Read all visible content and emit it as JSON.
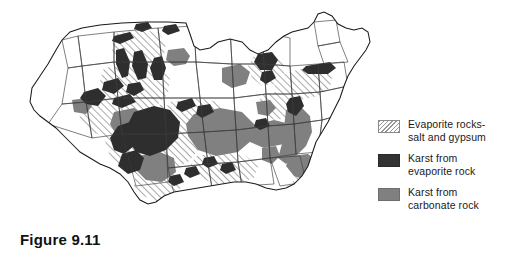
{
  "figure": {
    "caption": "Figure 9.11",
    "credit": "© JeremyCulpDesign/Shutterstock (modified)"
  },
  "map": {
    "title": "United States karst and evaporite rock distribution",
    "colors": {
      "outline": "#1a1a1a",
      "background": "#ffffff",
      "hatch_line": "#8c8c8c",
      "karst_evaporite": "#2e2e2e",
      "karst_carbonate": "#808080"
    }
  },
  "legend": {
    "items": [
      {
        "swatch": "hatch-pattern-swatch",
        "label": "Evaporite rocks-\nsalt and gypsum",
        "color": "#9a9a9a"
      },
      {
        "swatch": "dark-fill-swatch",
        "label": "Karst from\nevaporite rock",
        "color": "#333333"
      },
      {
        "swatch": "gray-fill-swatch",
        "label": "Karst from\ncarbonate rock",
        "color": "#808080"
      }
    ]
  }
}
